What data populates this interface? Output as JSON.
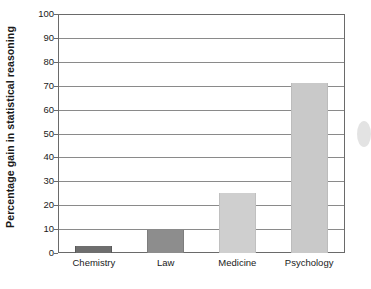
{
  "chart_data": {
    "type": "bar",
    "title": "",
    "subtitle": "",
    "xlabel": "",
    "ylabel": "Percentage gain in statistical reasoning",
    "categories": [
      "Chemistry",
      "Law",
      "Medicine",
      "Psychology"
    ],
    "values": [
      3,
      9.5,
      25,
      71
    ],
    "series": [
      {
        "name": "Percentage gain in statistical reasoning",
        "values": [
          3,
          9.5,
          25,
          71
        ]
      }
    ],
    "ylim": [
      0,
      100
    ],
    "y_ticks": [
      0,
      10,
      20,
      30,
      40,
      50,
      60,
      70,
      80,
      90,
      100
    ],
    "y_tick_labels": [
      "0",
      "10",
      "20",
      "30",
      "40",
      "50",
      "60",
      "70",
      "80",
      "90",
      "100"
    ],
    "grid": "horizontal",
    "legend": "none",
    "bar_colors": [
      "#6e6e6e",
      "#8d8d8d",
      "#cfcfcf",
      "#c9c9c9"
    ],
    "bar_edge_colors": [
      "#5a5a5a",
      "#7d7d7d",
      "#c0c0c0",
      "#bcbcbc"
    ],
    "annotations": []
  },
  "axes": {
    "y_title": "Percentage gain in statistical reasoning",
    "frame_color": "#6a6a6a",
    "gridline_color": "#8a8a8a"
  }
}
